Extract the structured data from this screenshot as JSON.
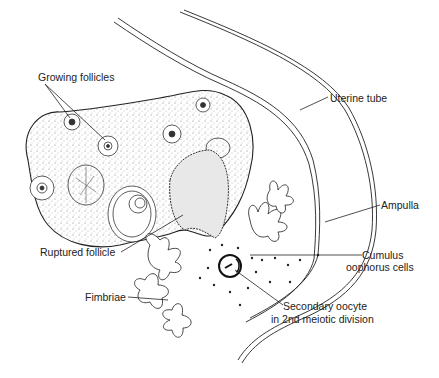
{
  "diagram": {
    "type": "anatomical-illustration",
    "labels": {
      "growing_follicles": "Growing follicles",
      "uterine_tube": "Uterine tube",
      "ampulla": "Ampulla",
      "cumulus_line1": "Cumulus",
      "cumulus_line2": "oophorus cells",
      "ruptured_follicle": "Ruptured follicle",
      "fimbriae": "Fimbriae",
      "oocyte_line1": "Secondary oocyte",
      "oocyte_line2": "in 2nd meiotic division"
    },
    "colors": {
      "ink": "#222222",
      "background": "#ffffff",
      "stipple": "#555555"
    }
  }
}
